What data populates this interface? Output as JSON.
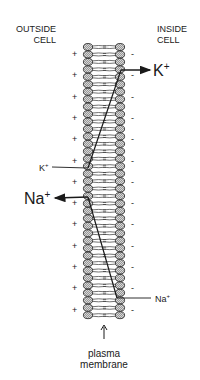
{
  "diagram": {
    "regions": {
      "outside": [
        "OUTSIDE",
        "CELL"
      ],
      "inside": [
        "INSIDE",
        "CELL"
      ]
    },
    "charges": {
      "outside_sign": "+",
      "inside_sign": "-"
    },
    "ions": {
      "k_inside_exit": {
        "symbol": "K",
        "charge": "+"
      },
      "k_outside_entry": {
        "symbol": "K",
        "charge": "+"
      },
      "na_outside_exit": {
        "symbol": "Na",
        "charge": "+"
      },
      "na_inside_entry": {
        "symbol": "Na",
        "charge": "+"
      }
    },
    "caption": [
      "plasma",
      "membrane"
    ],
    "colors": {
      "ink": "#1a1a1a",
      "head_fill": "#c8c8c8",
      "background": "#ffffff"
    }
  }
}
